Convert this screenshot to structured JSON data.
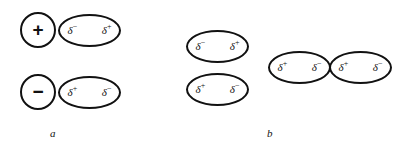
{
  "figure": {
    "background_color": "#ffffff",
    "stroke_color": "#111111",
    "text_color": "#111111",
    "panels": [
      {
        "id": "a",
        "label": "a",
        "label_x": 50,
        "label_y": 128,
        "shapes": [
          {
            "kind": "ion",
            "name": "cation-circle",
            "sign": "+",
            "x": 20,
            "y": 12
          },
          {
            "kind": "dipole",
            "name": "dipole-ellipse-top",
            "left_charge": "δ",
            "left_sign": "−",
            "right_charge": "δ",
            "right_sign": "+",
            "x": 58,
            "y": 14
          },
          {
            "kind": "ion",
            "name": "anion-circle",
            "sign": "−",
            "x": 20,
            "y": 74
          },
          {
            "kind": "dipole",
            "name": "dipole-ellipse-bottom",
            "left_charge": "δ",
            "left_sign": "+",
            "right_charge": "δ",
            "right_sign": "−",
            "x": 58,
            "y": 76
          }
        ]
      },
      {
        "id": "b",
        "label": "b",
        "label_x": 267,
        "label_y": 128,
        "shapes": [
          {
            "kind": "dipole",
            "name": "dipole-pair-upper",
            "left_charge": "δ",
            "left_sign": "−",
            "right_charge": "δ",
            "right_sign": "+",
            "x": 186,
            "y": 30
          },
          {
            "kind": "dipole",
            "name": "dipole-pair-lower",
            "left_charge": "δ",
            "left_sign": "+",
            "right_charge": "δ",
            "right_sign": "−",
            "x": 186,
            "y": 73
          },
          {
            "kind": "dipole",
            "name": "dipole-inline-left",
            "left_charge": "δ",
            "left_sign": "+",
            "right_charge": "δ",
            "right_sign": "−",
            "x": 268,
            "y": 51
          },
          {
            "kind": "dipole",
            "name": "dipole-inline-right",
            "left_charge": "δ",
            "left_sign": "+",
            "right_charge": "δ",
            "right_sign": "−",
            "x": 329,
            "y": 51
          }
        ]
      }
    ]
  }
}
